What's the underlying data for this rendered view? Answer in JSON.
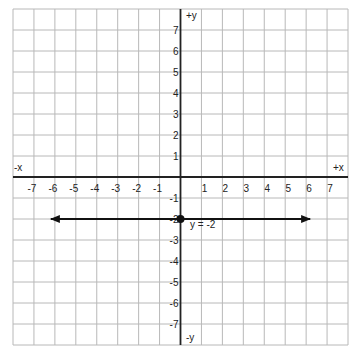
{
  "chart_data": {
    "type": "line",
    "title": "",
    "xlabel_pos": "+x",
    "xlabel_neg": "-x",
    "ylabel_pos": "+y",
    "ylabel_neg": "-y",
    "xlim": [
      -8,
      8
    ],
    "ylim": [
      -8,
      8
    ],
    "grid": true,
    "x_ticks": [
      -7,
      -6,
      -5,
      -4,
      -3,
      -2,
      -1,
      1,
      2,
      3,
      4,
      5,
      6,
      7
    ],
    "y_ticks": [
      7,
      6,
      5,
      4,
      3,
      2,
      1,
      -1,
      -2,
      -3,
      -4,
      -5,
      -6,
      -7
    ],
    "series": [
      {
        "name": "y = -2",
        "equation": "y = -2",
        "x": [
          -6,
          6
        ],
        "y": [
          -2,
          -2
        ],
        "arrows": "both"
      }
    ],
    "points": [
      {
        "x": 0,
        "y": -2
      }
    ],
    "annotations": [
      {
        "text": "y = -2",
        "x": 0.4,
        "y": -2.5
      }
    ]
  },
  "colors": {
    "grid": "#b8b8b8",
    "axis": "#222222",
    "line": "#111111"
  }
}
